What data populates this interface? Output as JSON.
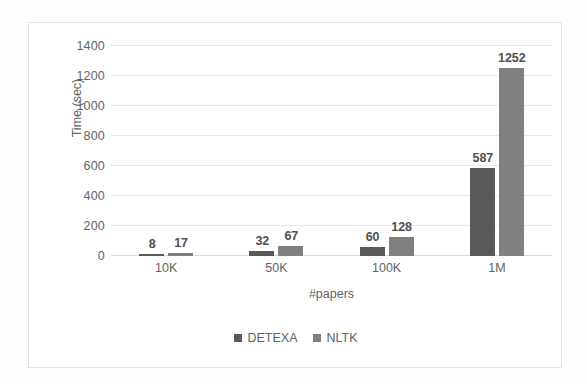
{
  "chart_data": {
    "type": "bar",
    "title": "",
    "xlabel": "#papers",
    "ylabel": "Time (sec)",
    "categories": [
      "10K",
      "50K",
      "100K",
      "1M"
    ],
    "series": [
      {
        "name": "DETEXA",
        "color": "#595959",
        "values": [
          8,
          32,
          60,
          587
        ]
      },
      {
        "name": "NLTK",
        "color": "#808080",
        "values": [
          17,
          67,
          128,
          1252
        ]
      }
    ],
    "ylim": [
      0,
      1400
    ],
    "yticks": [
      0,
      200,
      400,
      600,
      800,
      1000,
      1200,
      1400
    ],
    "ytick_labels": [
      "0",
      "200",
      "400",
      "600",
      "800",
      "1000",
      "1200",
      "1400"
    ],
    "grid": true,
    "legend_position": "bottom",
    "data_labels": true,
    "data_label_values": [
      [
        "8",
        "17"
      ],
      [
        "32",
        "67"
      ],
      [
        "60",
        "128"
      ],
      [
        "587",
        "1252"
      ]
    ]
  },
  "axes": {
    "y_title": "Time (sec)",
    "x_title": "#papers"
  },
  "legend": {
    "items": [
      {
        "label": "DETEXA",
        "color": "#595959"
      },
      {
        "label": "NLTK",
        "color": "#808080"
      }
    ]
  },
  "colors": {
    "series_detexa": "#595959",
    "series_nltk": "#808080",
    "gridline": "#e8e8e8",
    "text": "#636363",
    "frame": "#e3e3e3",
    "background": "#ffffff"
  }
}
